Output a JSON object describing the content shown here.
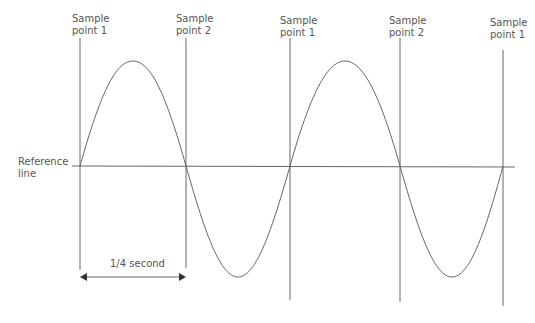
{
  "diagram": {
    "sample_labels": [
      {
        "line1": "Sample",
        "line2": "point 1",
        "x": 80
      },
      {
        "line1": "Sample",
        "line2": "point 2",
        "x": 186
      },
      {
        "line1": "Sample",
        "line2": "point 1",
        "x": 290
      },
      {
        "line1": "Sample",
        "line2": "point 2",
        "x": 400
      },
      {
        "line1": "Sample",
        "line2": "point 1",
        "x": 503
      }
    ],
    "reference_line": {
      "line1": "Reference",
      "line2": "line",
      "y": 166
    },
    "interval_label": "1/4 second",
    "colors": {
      "stroke": "#666666",
      "text": "#555555"
    }
  }
}
